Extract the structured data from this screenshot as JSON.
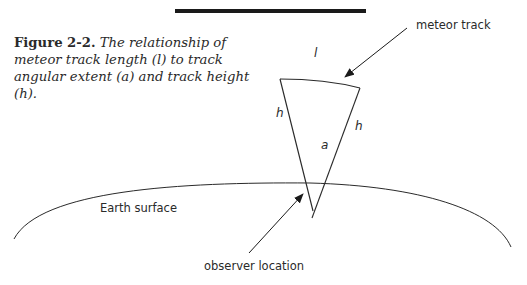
{
  "figure": {
    "label": "Figure 2-2.",
    "caption": " The relationship of meteor track length (l) to track angular extent (a) and track height (h)."
  },
  "labels": {
    "meteor_track": "meteor track",
    "earth_surface": "Earth surface",
    "observer_location": "observer location"
  },
  "variables": {
    "length": "l",
    "height_left": "h",
    "height_right": "h",
    "angle": "a"
  },
  "colors": {
    "line": "#2a2a2a",
    "bar": "#1a1a1a",
    "background": "#ffffff"
  }
}
